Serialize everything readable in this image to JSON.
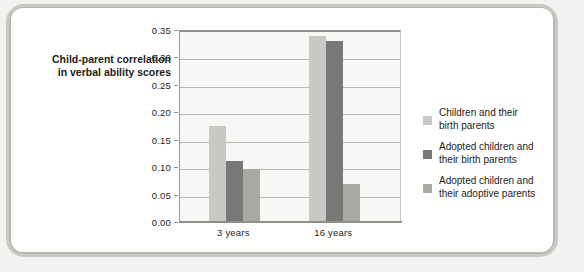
{
  "chart_data": {
    "type": "bar",
    "title": "",
    "xlabel": "",
    "ylabel": "Child-parent correlation in verbal ability scores",
    "ylabel_lines": [
      "Child-parent correlation",
      "in verbal ability scores"
    ],
    "categories": [
      "3 years",
      "16 years"
    ],
    "ylim": [
      0.0,
      0.35
    ],
    "ytick_labels": [
      "0.00",
      "0.05",
      "0.10",
      "0.15",
      "0.20",
      "0.25",
      "0.30",
      "0.35"
    ],
    "ytick_values": [
      0.0,
      0.05,
      0.1,
      0.15,
      0.2,
      0.25,
      0.3,
      0.35
    ],
    "grid": true,
    "legend_position": "right",
    "series": [
      {
        "name": "Children and their birth parents",
        "name_lines": [
          "Children and their",
          "birth parents"
        ],
        "color": "#c9c9c3",
        "values": [
          0.175,
          0.34
        ]
      },
      {
        "name": "Adopted children and their birth parents",
        "name_lines": [
          "Adopted children and",
          "their birth parents"
        ],
        "color": "#787878",
        "values": [
          0.112,
          0.33
        ]
      },
      {
        "name": "Adopted children and their adoptive parents",
        "name_lines": [
          "Adopted children and",
          "their adoptive parents"
        ],
        "color": "#a9a9a4",
        "values": [
          0.097,
          0.07
        ]
      }
    ]
  }
}
